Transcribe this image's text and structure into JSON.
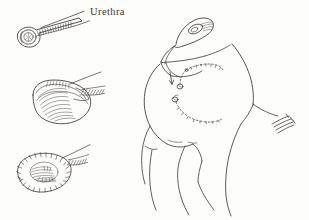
{
  "figure": {
    "title": "Urethra",
    "domain_note": "surgical line illustration",
    "background_color": "#fdfdfc",
    "ink_color": "#3a3632",
    "width": 309,
    "height": 220
  },
  "labels": [
    {
      "id": "urethra",
      "text": "Urethra",
      "x": 90,
      "y": 7,
      "color": "#3a3632"
    }
  ],
  "insets": [
    {
      "id": "inset-tube",
      "name": "urethral-tube-detail",
      "caption": "",
      "position": "top-left",
      "description": "tubular urethra segment with circular open lumen and cross-hatched wall"
    },
    {
      "id": "inset-opened",
      "name": "urethra-opened-detail",
      "caption": "",
      "position": "middle-left",
      "description": "longitudinally opened urethral segment with hatched inner surface"
    },
    {
      "id": "inset-flattened",
      "name": "urethra-flattened-graft-detail",
      "caption": "",
      "position": "bottom-left",
      "description": "flattened urethral plate graft outlined with interrupted sutures around perimeter"
    }
  ],
  "main_figure": {
    "id": "main-anatomy",
    "name": "pelvic-anatomy-drawing",
    "description": "line drawing of genital and perineal anatomy with dashed incision lines",
    "annotations": [
      {
        "id": "arrow-1",
        "name": "direction-arrow",
        "description": "small arrow indicating direction of dissection"
      },
      {
        "id": "dashed-suture-upper",
        "name": "dashed-suture-line-upper",
        "description": "upper dashed/beaded suture path"
      },
      {
        "id": "dashed-suture-lower",
        "name": "dashed-suture-line-lower",
        "description": "lower dashed/beaded suture path"
      },
      {
        "id": "hatch-marks-right",
        "name": "right-hatch-marks",
        "description": "short parallel hatch strokes on right margin"
      }
    ]
  },
  "colors": {
    "ink": "#3a3632",
    "ink_light": "#6a645e",
    "background": "#fdfdfc"
  }
}
